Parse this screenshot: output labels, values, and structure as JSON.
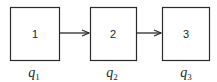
{
  "diagram": {
    "nodes": [
      {
        "id": "1",
        "label": "1",
        "caption_base": "q",
        "caption_sub": "1"
      },
      {
        "id": "2",
        "label": "2",
        "caption_base": "q",
        "caption_sub": "2"
      },
      {
        "id": "3",
        "label": "3",
        "caption_base": "q",
        "caption_sub": "3"
      }
    ],
    "edges": [
      {
        "from": "1",
        "to": "2"
      },
      {
        "from": "2",
        "to": "3"
      }
    ],
    "colors": {
      "stroke": "#2a2a2a",
      "text": "#222222",
      "background": "#ffffff"
    }
  }
}
